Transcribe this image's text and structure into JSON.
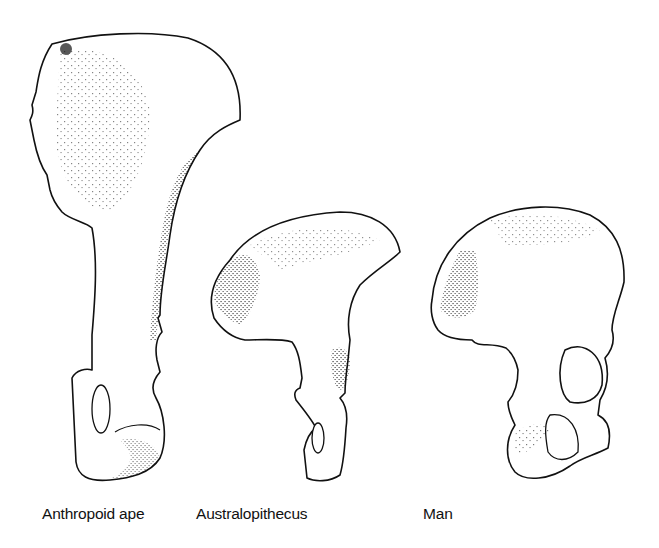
{
  "figure": {
    "specimens": [
      {
        "id": "ape",
        "label": "Anthropoid ape"
      },
      {
        "id": "australopithecus",
        "label": "Australopithecus"
      },
      {
        "id": "man",
        "label": "Man"
      }
    ]
  },
  "colors": {
    "background": "#ffffff",
    "ink": "#111111"
  }
}
